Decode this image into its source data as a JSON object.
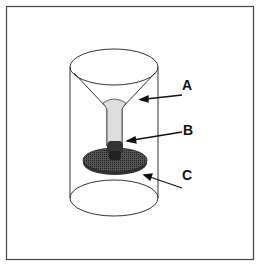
{
  "figure": {
    "labels": [
      {
        "id": "A",
        "text": "A",
        "target": "funnel"
      },
      {
        "id": "B",
        "text": "B",
        "target": "knob"
      },
      {
        "id": "C",
        "text": "C",
        "target": "filter-disc"
      }
    ]
  }
}
